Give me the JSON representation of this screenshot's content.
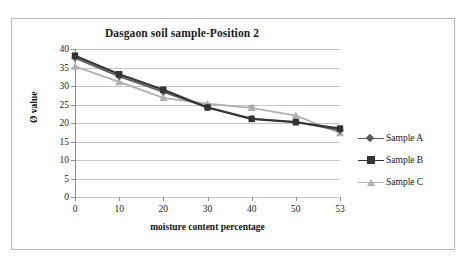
{
  "chart_data": {
    "type": "line",
    "title": "Dasgaon soil sample-Position 2",
    "xlabel": "moisture content percentage",
    "ylabel": "Ø value",
    "categories": [
      "0",
      "10",
      "20",
      "30",
      "40",
      "50",
      "53"
    ],
    "ylim": [
      0,
      40
    ],
    "yticks": [
      "0",
      "5",
      "10",
      "15",
      "20",
      "25",
      "30",
      "35",
      "40"
    ],
    "grid": true,
    "legend_position": "right",
    "series": [
      {
        "name": "Sample A",
        "marker": "diamond",
        "color": "#5d5d5d",
        "values": [
          37.6,
          32.6,
          28.4,
          24.2,
          21.2,
          20.3,
          18.0
        ]
      },
      {
        "name": "Sample B",
        "marker": "square",
        "color": "#333333",
        "values": [
          38.2,
          33.2,
          29.0,
          24.2,
          21.1,
          20.2,
          18.5
        ]
      },
      {
        "name": "Sample C",
        "marker": "triangle",
        "color": "#b0b0b0",
        "values": [
          35.3,
          31.1,
          26.8,
          25.2,
          24.1,
          22.0,
          17.3
        ]
      }
    ],
    "error_bars": [
      {
        "series": "Sample C",
        "category": "40",
        "low": 24.1,
        "high": 24.6
      }
    ]
  }
}
